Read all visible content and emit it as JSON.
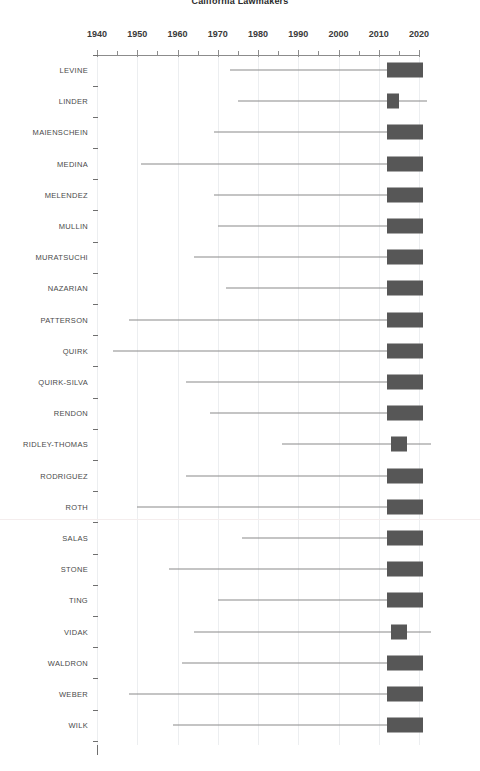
{
  "title": "California Lawmakers",
  "chart_data": {
    "type": "bar",
    "title": "California Lawmakers",
    "xlabel": "",
    "ylabel": "",
    "xlim": [
      1937,
      2024
    ],
    "xticks": [
      1940,
      1950,
      1960,
      1970,
      1980,
      1990,
      2000,
      2010,
      2020
    ],
    "xtick_labels": [
      "1940",
      "1950",
      "1960",
      "1970",
      "1980",
      "1990",
      "2000",
      "2010",
      "2020"
    ],
    "minor_tick_interval": 5,
    "grid": "vertical-light",
    "legend": "none",
    "orientation": "horizontal",
    "categories": [
      "LEVINE",
      "LINDER",
      "MAIENSCHEIN",
      "MEDINA",
      "MELENDEZ",
      "MULLIN",
      "MURATSUCHI",
      "NAZARIAN",
      "PATTERSON",
      "QUIRK",
      "QUIRK-SILVA",
      "RENDON",
      "RIDLEY-THOMAS",
      "RODRIGUEZ",
      "ROTH",
      "SALAS",
      "STONE",
      "TING",
      "VIDAK",
      "WALDRON",
      "WEBER",
      "WILK"
    ],
    "series": [
      {
        "name": "range_line",
        "description": "thin whisker line spanning earliest to latest year"
      },
      {
        "name": "tenure_box",
        "description": "dark box marking the recent service block"
      }
    ],
    "rows": [
      {
        "name": "LEVINE",
        "line_start": 1973,
        "line_end": 2021,
        "box_start": 2012,
        "box_end": 2021
      },
      {
        "name": "LINDER",
        "line_start": 1975,
        "line_end": 2022,
        "box_start": 2012,
        "box_end": 2015
      },
      {
        "name": "MAIENSCHEIN",
        "line_start": 1969,
        "line_end": 2021,
        "box_start": 2012,
        "box_end": 2021
      },
      {
        "name": "MEDINA",
        "line_start": 1951,
        "line_end": 2021,
        "box_start": 2012,
        "box_end": 2021
      },
      {
        "name": "MELENDEZ",
        "line_start": 1969,
        "line_end": 2021,
        "box_start": 2012,
        "box_end": 2021
      },
      {
        "name": "MULLIN",
        "line_start": 1970,
        "line_end": 2021,
        "box_start": 2012,
        "box_end": 2021
      },
      {
        "name": "MURATSUCHI",
        "line_start": 1964,
        "line_end": 2021,
        "box_start": 2012,
        "box_end": 2021
      },
      {
        "name": "NAZARIAN",
        "line_start": 1972,
        "line_end": 2021,
        "box_start": 2012,
        "box_end": 2021
      },
      {
        "name": "PATTERSON",
        "line_start": 1948,
        "line_end": 2021,
        "box_start": 2012,
        "box_end": 2021
      },
      {
        "name": "QUIRK",
        "line_start": 1944,
        "line_end": 2021,
        "box_start": 2012,
        "box_end": 2021
      },
      {
        "name": "QUIRK-SILVA",
        "line_start": 1962,
        "line_end": 2021,
        "box_start": 2012,
        "box_end": 2021
      },
      {
        "name": "RENDON",
        "line_start": 1968,
        "line_end": 2021,
        "box_start": 2012,
        "box_end": 2021
      },
      {
        "name": "RIDLEY-THOMAS",
        "line_start": 1986,
        "line_end": 2023,
        "box_start": 2013,
        "box_end": 2017
      },
      {
        "name": "RODRIGUEZ",
        "line_start": 1962,
        "line_end": 2021,
        "box_start": 2012,
        "box_end": 2021
      },
      {
        "name": "ROTH",
        "line_start": 1950,
        "line_end": 2021,
        "box_start": 2012,
        "box_end": 2021
      },
      {
        "name": "SALAS",
        "line_start": 1976,
        "line_end": 2021,
        "box_start": 2012,
        "box_end": 2021
      },
      {
        "name": "STONE",
        "line_start": 1958,
        "line_end": 2021,
        "box_start": 2012,
        "box_end": 2021
      },
      {
        "name": "TING",
        "line_start": 1970,
        "line_end": 2021,
        "box_start": 2012,
        "box_end": 2021
      },
      {
        "name": "VIDAK",
        "line_start": 1964,
        "line_end": 2023,
        "box_start": 2013,
        "box_end": 2017
      },
      {
        "name": "WALDRON",
        "line_start": 1961,
        "line_end": 2021,
        "box_start": 2012,
        "box_end": 2021
      },
      {
        "name": "WEBER",
        "line_start": 1948,
        "line_end": 2021,
        "box_start": 2012,
        "box_end": 2021
      },
      {
        "name": "WILK",
        "line_start": 1959,
        "line_end": 2021,
        "box_start": 2012,
        "box_end": 2021
      }
    ]
  },
  "colors": {
    "box": "#575757",
    "line": "#8a8a8a",
    "axis": "#6f6f6f",
    "grid": "#eceef0",
    "text": "#4a4a4a"
  }
}
